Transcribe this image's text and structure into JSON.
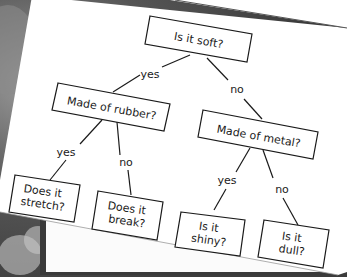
{
  "diagram": {
    "type": "decision-tree",
    "colors": {
      "paper": "#ffffff",
      "ink": "#1a1a1a",
      "background_photo": "#6e6e6e",
      "frame": "#3a3a3a"
    },
    "nodes": [
      {
        "id": "root",
        "lines": [
          "Is it soft?"
        ]
      },
      {
        "id": "rubber",
        "lines": [
          "Made of rubber?"
        ]
      },
      {
        "id": "metal",
        "lines": [
          "Made of metal?"
        ]
      },
      {
        "id": "stretch",
        "lines": [
          "Does it",
          "stretch?"
        ]
      },
      {
        "id": "break",
        "lines": [
          "Does it",
          "break?"
        ]
      },
      {
        "id": "shiny",
        "lines": [
          "Is it",
          "shiny?"
        ]
      },
      {
        "id": "dull",
        "lines": [
          "Is it",
          "dull?"
        ]
      }
    ],
    "edges": [
      {
        "from": "root",
        "to": "rubber",
        "label": "yes"
      },
      {
        "from": "root",
        "to": "metal",
        "label": "no"
      },
      {
        "from": "rubber",
        "to": "stretch",
        "label": "yes"
      },
      {
        "from": "rubber",
        "to": "break",
        "label": "no"
      },
      {
        "from": "metal",
        "to": "shiny",
        "label": "yes"
      },
      {
        "from": "metal",
        "to": "dull",
        "label": "no"
      }
    ]
  }
}
